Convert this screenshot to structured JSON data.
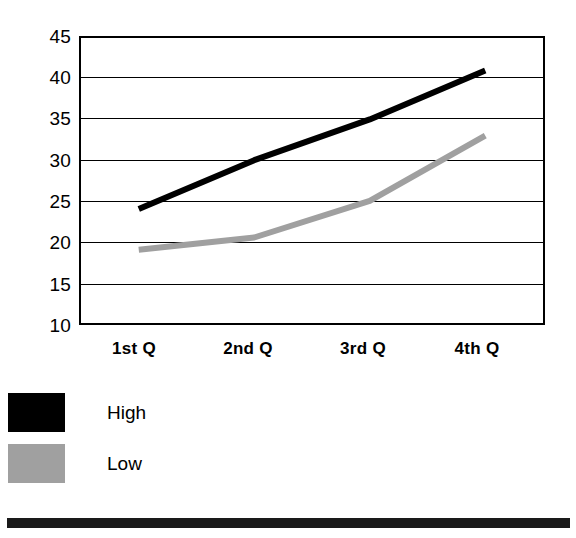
{
  "chart_data": {
    "type": "line",
    "title": "",
    "subtitle": "",
    "xlabel": "",
    "ylabel": "",
    "categories": [
      "1st Q",
      "2nd Q",
      "3rd Q",
      "4th Q"
    ],
    "series": [
      {
        "name": "High",
        "values": [
          24,
          30,
          35,
          41
        ],
        "color": "#000000"
      },
      {
        "name": "Low",
        "values": [
          19,
          20.5,
          25,
          33
        ],
        "color": "#a0a0a0"
      }
    ],
    "ylim": [
      10,
      45
    ],
    "yticks": [
      45,
      40,
      35,
      30,
      25,
      20,
      15,
      10
    ],
    "ytick_labels": [
      "45",
      "40",
      "35",
      "30",
      "25",
      "20",
      "15",
      "10"
    ],
    "grid": true,
    "grid_axis": "y",
    "legend_position": "below-left",
    "annotations": []
  },
  "axes": {
    "y_labels": [
      "45",
      "40",
      "35",
      "30",
      "25",
      "20",
      "15",
      "10"
    ],
    "x_labels": [
      "1st Q",
      "2nd Q",
      "3rd Q",
      "4th Q"
    ]
  },
  "legend": {
    "entries": [
      {
        "label": "High",
        "color": "#000000",
        "swatch_name": "legend-swatch-high"
      },
      {
        "label": "Low",
        "color": "#a0a0a0",
        "swatch_name": "legend-swatch-low"
      }
    ]
  },
  "colors": {
    "high_series": "#000000",
    "low_series": "#a0a0a0",
    "frame": "#000000",
    "gridline": "#000000",
    "background": "#ffffff",
    "bottom_rule": "#1a1a1a"
  }
}
